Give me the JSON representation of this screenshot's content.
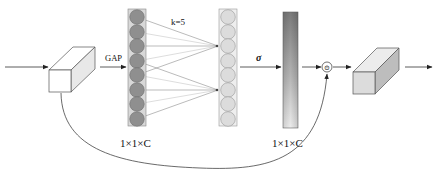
{
  "diagram": {
    "labels": {
      "gap": "GAP",
      "kernel": "k=5",
      "sigma": "σ",
      "left_dim": "1×1×C",
      "right_dim": "1×1×C",
      "multiply": "⊙"
    },
    "nodes": [
      {
        "id": "input-arrow",
        "type": "arrow"
      },
      {
        "id": "input-feature-cube",
        "type": "cube",
        "fill": "#ffffff",
        "side_fill": "#e6e6e6"
      },
      {
        "id": "gap-arrow",
        "type": "arrow",
        "label": "GAP"
      },
      {
        "id": "pooled-vector",
        "type": "circle-column",
        "count": 8,
        "fill": "#8f8f8f"
      },
      {
        "id": "conv1d-connections",
        "type": "connections",
        "label": "k=5"
      },
      {
        "id": "conv-output-vector",
        "type": "circle-column",
        "count": 8,
        "fill": "#dcdcdc"
      },
      {
        "id": "sigmoid-arrow",
        "type": "arrow",
        "label": "σ"
      },
      {
        "id": "attention-weights-bar",
        "type": "gradient-bar",
        "label": "1×1×C"
      },
      {
        "id": "multiply-node",
        "type": "operator",
        "symbol": "⊙"
      },
      {
        "id": "output-feature-cube",
        "type": "cube",
        "fill": "#dedede",
        "side_fill": "#bdbdbd"
      },
      {
        "id": "output-arrow",
        "type": "arrow"
      },
      {
        "id": "skip-connection",
        "type": "curve"
      }
    ],
    "colors": {
      "stroke": "#444444",
      "circle_dark": "#8f8f8f",
      "circle_light": "#dcdcdc",
      "bar_dark": "#7a7a7a",
      "bar_light": "#f0f0f0"
    }
  }
}
